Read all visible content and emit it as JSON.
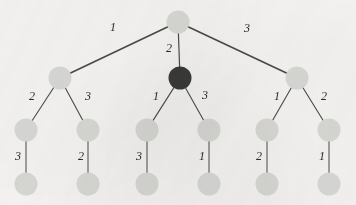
{
  "diagram": {
    "type": "tree",
    "background_color": "#f5f4f2",
    "node_fill_light": "#d8d8d5",
    "node_fill_dark": "#3a3a38",
    "edge_color": "#4a4a48",
    "label_color": "#2b2b2b",
    "nodes": [
      {
        "id": "root",
        "x": 178,
        "y": 22,
        "r": 11.5,
        "style": "light",
        "level": 0
      },
      {
        "id": "n-l",
        "x": 60,
        "y": 78,
        "r": 11.5,
        "style": "light",
        "level": 1
      },
      {
        "id": "n-c",
        "x": 180,
        "y": 78,
        "r": 11.5,
        "style": "dark",
        "level": 1
      },
      {
        "id": "n-r",
        "x": 297,
        "y": 78,
        "r": 11.5,
        "style": "light",
        "level": 1
      },
      {
        "id": "n-l-a",
        "x": 26,
        "y": 130,
        "r": 11.5,
        "style": "light",
        "level": 2
      },
      {
        "id": "n-l-b",
        "x": 88,
        "y": 130,
        "r": 11.5,
        "style": "light",
        "level": 2
      },
      {
        "id": "n-c-a",
        "x": 147,
        "y": 130,
        "r": 11.5,
        "style": "light",
        "level": 2
      },
      {
        "id": "n-c-b",
        "x": 209,
        "y": 130,
        "r": 11.5,
        "style": "light",
        "level": 2
      },
      {
        "id": "n-r-a",
        "x": 267,
        "y": 130,
        "r": 11.5,
        "style": "light",
        "level": 2
      },
      {
        "id": "n-r-b",
        "x": 329,
        "y": 130,
        "r": 11.5,
        "style": "light",
        "level": 2
      },
      {
        "id": "n-l-a-1",
        "x": 26,
        "y": 184,
        "r": 11.5,
        "style": "light",
        "level": 3
      },
      {
        "id": "n-l-b-1",
        "x": 88,
        "y": 184,
        "r": 11.5,
        "style": "light",
        "level": 3
      },
      {
        "id": "n-c-a-1",
        "x": 147,
        "y": 184,
        "r": 11.5,
        "style": "light",
        "level": 3
      },
      {
        "id": "n-c-b-1",
        "x": 209,
        "y": 184,
        "r": 11.5,
        "style": "light",
        "level": 3
      },
      {
        "id": "n-r-a-1",
        "x": 267,
        "y": 184,
        "r": 11.5,
        "style": "light",
        "level": 3
      },
      {
        "id": "n-r-b-1",
        "x": 329,
        "y": 184,
        "r": 11.5,
        "style": "light",
        "level": 3
      }
    ],
    "edges": [
      {
        "id": "e-root-l",
        "from": "root",
        "to": "n-l",
        "weight": "1",
        "label_x": 113,
        "label_y": 28,
        "width": 1.6
      },
      {
        "id": "e-root-c",
        "from": "root",
        "to": "n-c",
        "weight": "2",
        "label_x": 169,
        "label_y": 49,
        "width": 1.2
      },
      {
        "id": "e-root-r",
        "from": "root",
        "to": "n-r",
        "weight": "3",
        "label_x": 247,
        "label_y": 29,
        "width": 1.6
      },
      {
        "id": "e-l-a",
        "from": "n-l",
        "to": "n-l-a",
        "weight": "2",
        "label_x": 32,
        "label_y": 97,
        "width": 1.1
      },
      {
        "id": "e-l-b",
        "from": "n-l",
        "to": "n-l-b",
        "weight": "3",
        "label_x": 88,
        "label_y": 97,
        "width": 1.1
      },
      {
        "id": "e-c-a",
        "from": "n-c",
        "to": "n-c-a",
        "weight": "1",
        "label_x": 156,
        "label_y": 97,
        "width": 1.1
      },
      {
        "id": "e-c-b",
        "from": "n-c",
        "to": "n-c-b",
        "weight": "3",
        "label_x": 205,
        "label_y": 96,
        "width": 1.1
      },
      {
        "id": "e-r-a",
        "from": "n-r",
        "to": "n-r-a",
        "weight": "1",
        "label_x": 277,
        "label_y": 97,
        "width": 1.1
      },
      {
        "id": "e-r-b",
        "from": "n-r",
        "to": "n-r-b",
        "weight": "2",
        "label_x": 324,
        "label_y": 97,
        "width": 1.1
      },
      {
        "id": "e-l-a-1",
        "from": "n-l-a",
        "to": "n-l-a-1",
        "weight": "3",
        "label_x": 18,
        "label_y": 157,
        "width": 1.0
      },
      {
        "id": "e-l-b-1",
        "from": "n-l-b",
        "to": "n-l-b-1",
        "weight": "2",
        "label_x": 81,
        "label_y": 157,
        "width": 1.0
      },
      {
        "id": "e-c-a-1",
        "from": "n-c-a",
        "to": "n-c-a-1",
        "weight": "3",
        "label_x": 139,
        "label_y": 157,
        "width": 1.0
      },
      {
        "id": "e-c-b-1",
        "from": "n-c-b",
        "to": "n-c-b-1",
        "weight": "1",
        "label_x": 202,
        "label_y": 157,
        "width": 1.0
      },
      {
        "id": "e-r-a-1",
        "from": "n-r-a",
        "to": "n-r-a-1",
        "weight": "2",
        "label_x": 259,
        "label_y": 157,
        "width": 1.0
      },
      {
        "id": "e-r-b-1",
        "from": "n-r-b",
        "to": "n-r-b-1",
        "weight": "1",
        "label_x": 322,
        "label_y": 157,
        "width": 1.0
      }
    ]
  }
}
